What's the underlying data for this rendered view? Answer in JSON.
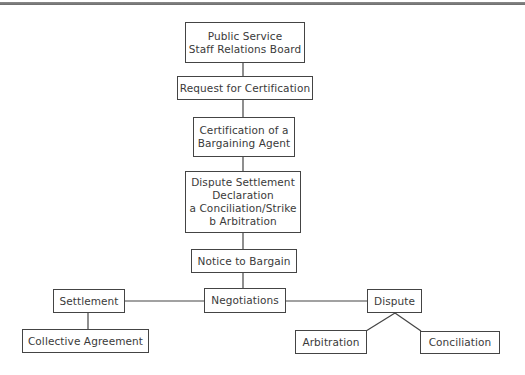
{
  "diagram": {
    "type": "flowchart",
    "nodes": {
      "board": {
        "lines": [
          "Public Service",
          "Staff Relations Board"
        ]
      },
      "request": {
        "lines": [
          "Request for Certification"
        ]
      },
      "certification": {
        "lines": [
          "Certification of a",
          "Bargaining Agent"
        ]
      },
      "declaration": {
        "lines": [
          "Dispute Settlement",
          "Declaration",
          "a Conciliation/Strike",
          "b Arbitration"
        ]
      },
      "notice": {
        "lines": [
          "Notice to Bargain"
        ]
      },
      "negotiations": {
        "lines": [
          "Negotiations"
        ]
      },
      "settlement": {
        "lines": [
          "Settlement"
        ]
      },
      "agreement": {
        "lines": [
          "Collective Agreement"
        ]
      },
      "dispute": {
        "lines": [
          "Dispute"
        ]
      },
      "arbitration": {
        "lines": [
          "Arbitration"
        ]
      },
      "conciliation": {
        "lines": [
          "Conciliation"
        ]
      }
    },
    "edges": [
      [
        "board",
        "request"
      ],
      [
        "request",
        "certification"
      ],
      [
        "certification",
        "declaration"
      ],
      [
        "declaration",
        "notice"
      ],
      [
        "notice",
        "negotiations"
      ],
      [
        "negotiations",
        "settlement"
      ],
      [
        "negotiations",
        "dispute"
      ],
      [
        "settlement",
        "agreement"
      ],
      [
        "dispute",
        "arbitration"
      ],
      [
        "dispute",
        "conciliation"
      ]
    ],
    "colors": {
      "line": "#444444",
      "text": "#3a3a3a",
      "rule": "#7a7a7a"
    }
  }
}
